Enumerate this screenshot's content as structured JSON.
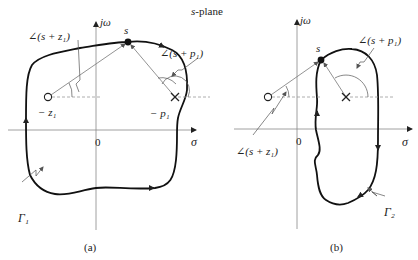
{
  "title": "s-plane",
  "panels": [
    {
      "id": "a",
      "caption": "(a)",
      "axes": {
        "vertical": "jω",
        "horizontal": "σ",
        "origin": "0"
      },
      "point_label": "s",
      "zero_label": "− z₁",
      "pole_label": "− p₁",
      "zero_angle_label": "∠(s + z₁)",
      "pole_angle_label": "∠(s + p₁)",
      "contour_label": "Γ₁"
    },
    {
      "id": "b",
      "caption": "(b)",
      "axes": {
        "vertical": "jω",
        "horizontal": "σ",
        "origin": "0"
      },
      "point_label": "s",
      "zero_angle_label": "∠(s + z₁)",
      "pole_angle_label": "∠(s + p₁)",
      "contour_label": "Γ₂"
    }
  ]
}
